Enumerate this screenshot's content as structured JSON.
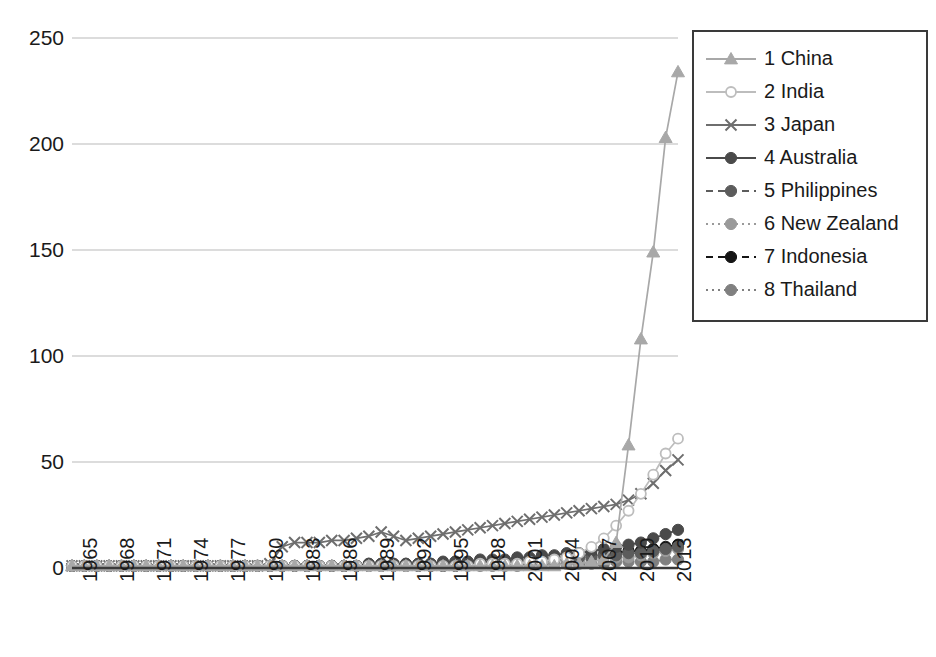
{
  "chart_data": {
    "type": "line",
    "title": "",
    "xlabel": "",
    "ylabel": "",
    "ylim": [
      0,
      250
    ],
    "yticks": [
      0,
      50,
      100,
      150,
      200,
      250
    ],
    "grid": true,
    "legend_position": "right",
    "x": [
      1965,
      1966,
      1967,
      1968,
      1969,
      1970,
      1971,
      1972,
      1973,
      1974,
      1975,
      1976,
      1977,
      1978,
      1979,
      1980,
      1981,
      1982,
      1983,
      1984,
      1985,
      1986,
      1987,
      1988,
      1989,
      1990,
      1991,
      1992,
      1993,
      1994,
      1995,
      1996,
      1997,
      1998,
      1999,
      2000,
      2001,
      2002,
      2003,
      2004,
      2005,
      2006,
      2007,
      2008,
      2009,
      2010,
      2011,
      2012,
      2013,
      2014
    ],
    "xticks": [
      1965,
      1968,
      1971,
      1974,
      1977,
      1980,
      1983,
      1986,
      1989,
      1992,
      1995,
      1998,
      2001,
      2004,
      2007,
      2010,
      2013
    ],
    "series": [
      {
        "name": "1 China",
        "legend_label": "1 China",
        "rank": 1,
        "color": "#a8a8a8",
        "marker": "triangle",
        "dash": "solid",
        "values": [
          1,
          1,
          1,
          1,
          1,
          1,
          1,
          1,
          1,
          1,
          1,
          1,
          1,
          1,
          1,
          1,
          1,
          1,
          1,
          1,
          1,
          1,
          1,
          1,
          1,
          1,
          1,
          1,
          1,
          1,
          1,
          1,
          1,
          1,
          1,
          1,
          1,
          1,
          1,
          1,
          2,
          2,
          3,
          4,
          12,
          58,
          108,
          149,
          203,
          234
        ]
      },
      {
        "name": "2 India",
        "legend_label": "2 India",
        "rank": 2,
        "color": "#bdbdbd",
        "marker": "circle-open",
        "dash": "solid",
        "values": [
          1,
          1,
          1,
          1,
          1,
          1,
          1,
          1,
          1,
          1,
          1,
          1,
          1,
          1,
          1,
          1,
          1,
          1,
          1,
          1,
          1,
          1,
          1,
          1,
          1,
          1,
          1,
          1,
          1,
          1,
          1,
          1,
          1,
          2,
          2,
          2,
          2,
          3,
          3,
          4,
          5,
          7,
          10,
          14,
          20,
          27,
          35,
          44,
          54,
          61
        ]
      },
      {
        "name": "3 Japan",
        "legend_label": "3 Japan",
        "rank": 3,
        "color": "#6e6e6e",
        "marker": "cross",
        "dash": "solid",
        "values": [
          1,
          1,
          1,
          1,
          1,
          1,
          1,
          1,
          1,
          1,
          1,
          1,
          1,
          1,
          1,
          1,
          2,
          10,
          12,
          12,
          12,
          13,
          13,
          14,
          15,
          17,
          15,
          13,
          14,
          15,
          16,
          17,
          18,
          19,
          20,
          21,
          22,
          23,
          24,
          25,
          26,
          27,
          28,
          29,
          30,
          32,
          35,
          40,
          46,
          51
        ]
      },
      {
        "name": "4 Australia",
        "legend_label": "4 Australia",
        "rank": 4,
        "color": "#4a4a4a",
        "marker": "circle",
        "dash": "solid",
        "values": [
          1,
          1,
          1,
          1,
          1,
          1,
          1,
          1,
          1,
          1,
          1,
          1,
          1,
          1,
          1,
          1,
          1,
          1,
          1,
          1,
          1,
          1,
          1,
          1,
          2,
          2,
          2,
          2,
          2,
          2,
          3,
          3,
          3,
          4,
          4,
          4,
          5,
          5,
          6,
          6,
          7,
          7,
          8,
          9,
          10,
          11,
          12,
          14,
          16,
          18
        ]
      },
      {
        "name": "5 Philippines",
        "legend_label": "5 Philippines",
        "rank": 5,
        "color": "#5c5c5c",
        "marker": "circle",
        "dash": "dashed",
        "values": [
          1,
          1,
          1,
          1,
          1,
          1,
          1,
          1,
          1,
          1,
          1,
          1,
          1,
          1,
          1,
          1,
          1,
          1,
          1,
          1,
          1,
          1,
          1,
          1,
          2,
          2,
          2,
          2,
          2,
          2,
          2,
          3,
          3,
          3,
          3,
          3,
          4,
          4,
          4,
          4,
          5,
          5,
          5,
          6,
          6,
          7,
          7,
          8,
          9,
          10
        ]
      },
      {
        "name": "6 New Zealand",
        "legend_label": "6 New Zealand",
        "rank": 6,
        "color": "#9a9a9a",
        "marker": "circle",
        "dash": "dotted",
        "values": [
          1,
          1,
          1,
          1,
          1,
          1,
          1,
          1,
          1,
          1,
          1,
          1,
          1,
          1,
          1,
          1,
          1,
          1,
          1,
          1,
          1,
          1,
          1,
          1,
          1,
          1,
          1,
          1,
          2,
          2,
          2,
          2,
          2,
          2,
          2,
          3,
          3,
          3,
          3,
          3,
          4,
          4,
          4,
          5,
          5,
          5,
          6,
          7,
          8,
          9
        ]
      },
      {
        "name": "7 Indonesia",
        "legend_label": "7 Indonesia",
        "rank": 7,
        "color": "#151515",
        "marker": "circle",
        "dash": "dashed",
        "values": [
          1,
          1,
          1,
          1,
          1,
          1,
          1,
          1,
          1,
          1,
          1,
          1,
          1,
          1,
          1,
          1,
          1,
          1,
          1,
          1,
          1,
          1,
          1,
          1,
          1,
          1,
          1,
          1,
          1,
          1,
          1,
          1,
          2,
          2,
          2,
          2,
          3,
          3,
          4,
          4,
          5,
          5,
          6,
          6,
          7,
          8,
          8,
          9,
          10,
          11
        ]
      },
      {
        "name": "8 Thailand",
        "legend_label": "8 Thailand",
        "rank": 8,
        "color": "#808080",
        "marker": "circle",
        "dash": "dotted",
        "values": [
          1,
          1,
          1,
          1,
          1,
          1,
          1,
          1,
          1,
          1,
          1,
          1,
          1,
          1,
          1,
          1,
          1,
          1,
          1,
          1,
          1,
          1,
          1,
          1,
          1,
          1,
          1,
          1,
          1,
          1,
          1,
          1,
          1,
          1,
          1,
          1,
          1,
          2,
          2,
          2,
          2,
          2,
          2,
          2,
          3,
          3,
          3,
          3,
          4,
          4
        ]
      }
    ]
  },
  "axes": {
    "y_tick_labels": [
      "250",
      "200",
      "150",
      "100",
      "50",
      "0"
    ],
    "x_tick_labels": [
      "1965",
      "1968",
      "1971",
      "1974",
      "1977",
      "1980",
      "1983",
      "1986",
      "1989",
      "1992",
      "1995",
      "1998",
      "2001",
      "2004",
      "2007",
      "2010",
      "2013"
    ]
  },
  "legend": {
    "entries": [
      {
        "label": "1 China"
      },
      {
        "label": "2 India"
      },
      {
        "label": "3 Japan"
      },
      {
        "label": "4 Australia"
      },
      {
        "label": "5 Philippines"
      },
      {
        "label": "6 New Zealand"
      },
      {
        "label": "7 Indonesia"
      },
      {
        "label": "8 Thailand"
      }
    ]
  },
  "colors": {
    "grid": "#b9b9b9",
    "axis": "#3a3a3a",
    "text": "#1a1a1a",
    "background": "#ffffff"
  }
}
